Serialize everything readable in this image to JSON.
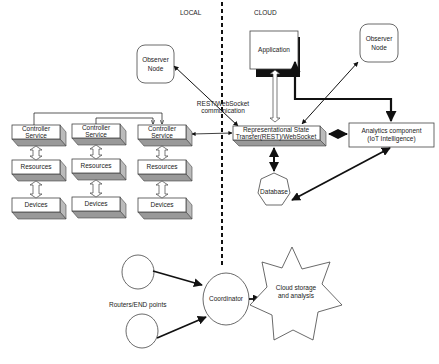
{
  "regions": {
    "local_label": "LOCAL",
    "cloud_label": "CLOUD"
  },
  "local": {
    "observer_node": {
      "line1": "Observer",
      "line2": "Node"
    },
    "stacks": [
      {
        "controller": {
          "line1": "Controller",
          "line2": "Service"
        },
        "resources": "Resources",
        "devices": "Devices"
      },
      {
        "controller": {
          "line1": "Controller",
          "line2": "Service"
        },
        "resources": "Resources",
        "devices": "Devices"
      },
      {
        "controller": {
          "line1": "Controller",
          "line2": "Service"
        },
        "resources": "Resources",
        "devices": "Devices"
      }
    ]
  },
  "cloud": {
    "application": "Application",
    "observer_node": {
      "line1": "Observer",
      "line2": "Node"
    },
    "rest": {
      "line1": "Representational State",
      "line2": "Transfer(REST)/WebSocket"
    },
    "analytics": {
      "line1": "Analytics component",
      "line2": "(IoT Intelligence)"
    },
    "database": "Database"
  },
  "edges": {
    "rest_comm_label": {
      "line1": "REST/WebSocket",
      "line2": "communication"
    }
  },
  "bottom": {
    "routers_label": "Routers/END points",
    "coordinator": "Coordinator",
    "cloud_storage": {
      "line1": "Cloud storage",
      "line2": "and analysis"
    }
  },
  "colors": {
    "stroke": "#111111",
    "box_side": "#bbbbbb",
    "box_bottom": "#999999",
    "background": "#ffffff"
  }
}
